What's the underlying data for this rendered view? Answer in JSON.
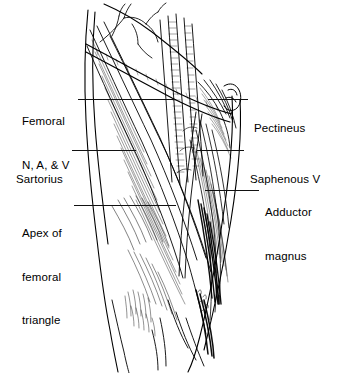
{
  "figure": {
    "background_color": "#ffffff",
    "ink_color": "#000000",
    "leader_line_color": "#111111",
    "artist_signature": "A.S.W."
  },
  "labels": {
    "femoral_nav": {
      "line1": "Femoral",
      "line2": "N, A, & V"
    },
    "sartorius": {
      "line1": "Sartorius"
    },
    "apex": {
      "line1": "Apex of",
      "line2": "femoral",
      "line3": "triangle"
    },
    "pectineus": {
      "line1": "Pectineus"
    },
    "saphenous": {
      "line1": "Saphenous V"
    },
    "adductor": {
      "line1": "Adductor",
      "line2": "magnus"
    }
  }
}
